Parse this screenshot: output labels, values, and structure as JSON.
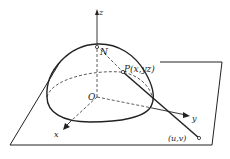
{
  "diagram": {
    "labels": {
      "z_axis": "z",
      "x_axis": "x",
      "y_axis": "y",
      "north_pole": "N",
      "origin": "O",
      "point_p": "P(x,yz)",
      "projection": "(u,v)"
    },
    "colors": {
      "stroke": "#222222",
      "background": "#ffffff"
    }
  }
}
